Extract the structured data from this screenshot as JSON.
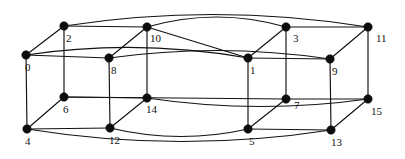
{
  "figure": {
    "background_color": "#ffffff",
    "edge_color": "#111111",
    "vertex_color": "#0d0d0d",
    "label_color": "#111111",
    "width": 405,
    "height": 159
  },
  "chart_data": {
    "type": "diagram",
    "graph_kind": "node-link",
    "directed": false,
    "node_count": 16,
    "edge_count": 32,
    "nodes": [
      {
        "id": "0",
        "label": "0",
        "x": 26,
        "y": 55,
        "label_dx": -1,
        "label_dy": 13
      },
      {
        "id": "1",
        "label": "1",
        "x": 248,
        "y": 58,
        "label_dx": 2,
        "label_dy": 13
      },
      {
        "id": "2",
        "label": "2",
        "x": 64,
        "y": 26,
        "label_dx": 2,
        "label_dy": 13
      },
      {
        "id": "3",
        "label": "3",
        "x": 286,
        "y": 27,
        "label_dx": 7,
        "label_dy": 12
      },
      {
        "id": "4",
        "label": "4",
        "x": 27,
        "y": 129,
        "label_dx": -2,
        "label_dy": 13
      },
      {
        "id": "5",
        "label": "5",
        "x": 248,
        "y": 129,
        "label_dx": 1,
        "label_dy": 13
      },
      {
        "id": "6",
        "label": "6",
        "x": 64,
        "y": 97,
        "label_dx": -1,
        "label_dy": 13
      },
      {
        "id": "7",
        "label": "7",
        "x": 286,
        "y": 99,
        "label_dx": 8,
        "label_dy": 7
      },
      {
        "id": "8",
        "label": "8",
        "x": 109,
        "y": 58,
        "label_dx": 2,
        "label_dy": 13
      },
      {
        "id": "9",
        "label": "9",
        "x": 330,
        "y": 59,
        "label_dx": 2,
        "label_dy": 13
      },
      {
        "id": "10",
        "label": "10",
        "x": 147,
        "y": 27,
        "label_dx": 3,
        "label_dy": 12
      },
      {
        "id": "11",
        "label": "11",
        "x": 368,
        "y": 27,
        "label_dx": 8,
        "label_dy": 12
      },
      {
        "id": "12",
        "label": "12",
        "x": 110,
        "y": 128,
        "label_dx": -1,
        "label_dy": 13
      },
      {
        "id": "13",
        "label": "13",
        "x": 331,
        "y": 130,
        "label_dx": 0,
        "label_dy": 13
      },
      {
        "id": "14",
        "label": "14",
        "x": 147,
        "y": 98,
        "label_dx": -1,
        "label_dy": 12
      },
      {
        "id": "15",
        "label": "15",
        "x": 368,
        "y": 99,
        "label_dx": 3,
        "label_dy": 13
      }
    ],
    "edges": [
      {
        "source": "0",
        "target": "2",
        "curve": 0
      },
      {
        "source": "0",
        "target": "4",
        "curve": 0
      },
      {
        "source": "0",
        "target": "8",
        "curve": 0
      },
      {
        "source": "0",
        "target": "1",
        "curve": -9
      },
      {
        "source": "2",
        "target": "10",
        "curve": 0
      },
      {
        "source": "2",
        "target": "6",
        "curve": 0
      },
      {
        "source": "2",
        "target": "11",
        "curve": -12
      },
      {
        "source": "4",
        "target": "6",
        "curve": 0
      },
      {
        "source": "4",
        "target": "12",
        "curve": 0
      },
      {
        "source": "4",
        "target": "13",
        "curve": 12
      },
      {
        "source": "6",
        "target": "14",
        "curve": 0
      },
      {
        "source": "6",
        "target": "7",
        "curve": 0
      },
      {
        "source": "8",
        "target": "10",
        "curve": 0
      },
      {
        "source": "8",
        "target": "12",
        "curve": 0
      },
      {
        "source": "8",
        "target": "9",
        "curve": -8
      },
      {
        "source": "10",
        "target": "14",
        "curve": 0
      },
      {
        "source": "10",
        "target": "1",
        "curve": 0
      },
      {
        "source": "12",
        "target": "14",
        "curve": 0
      },
      {
        "source": "12",
        "target": "5",
        "curve": 8
      },
      {
        "source": "14",
        "target": "15",
        "curve": 8
      },
      {
        "source": "1",
        "target": "3",
        "curve": 0
      },
      {
        "source": "1",
        "target": "5",
        "curve": 0
      },
      {
        "source": "1",
        "target": "9",
        "curve": 0
      },
      {
        "source": "3",
        "target": "11",
        "curve": 0
      },
      {
        "source": "3",
        "target": "7",
        "curve": 0
      },
      {
        "source": "3",
        "target": "10",
        "curve": -10
      },
      {
        "source": "5",
        "target": "7",
        "curve": 0
      },
      {
        "source": "5",
        "target": "13",
        "curve": 0
      },
      {
        "source": "7",
        "target": "15",
        "curve": 0
      },
      {
        "source": "9",
        "target": "11",
        "curve": 0
      },
      {
        "source": "9",
        "target": "13",
        "curve": 0
      },
      {
        "source": "11",
        "target": "15",
        "curve": 0
      },
      {
        "source": "13",
        "target": "15",
        "curve": 0
      }
    ],
    "vertex_radius": 4.2
  }
}
